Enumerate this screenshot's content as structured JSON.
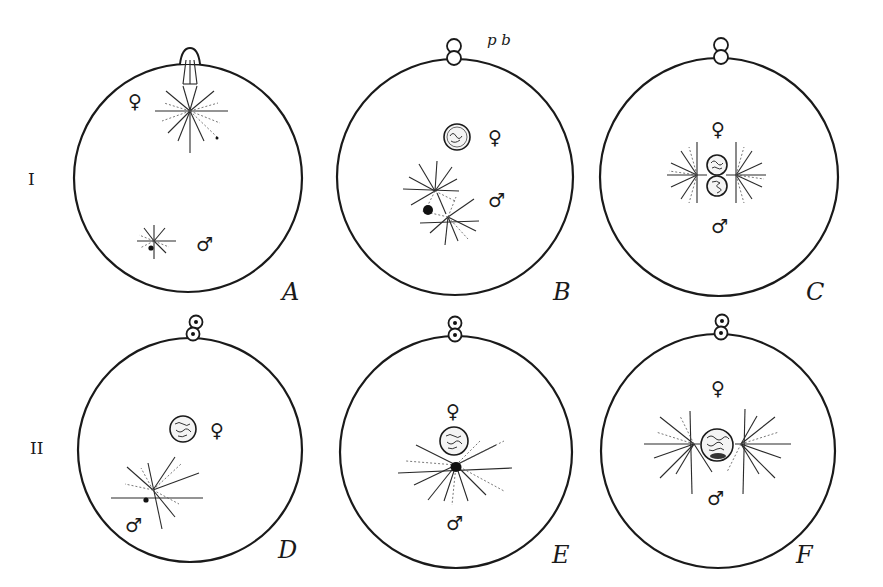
{
  "figure": {
    "row_labels": {
      "row1": "I",
      "row2": "II"
    },
    "polar_body_label": "p b",
    "symbols": {
      "female": "♀",
      "male": "♂"
    },
    "panels": [
      {
        "id": "A",
        "label": "A"
      },
      {
        "id": "B",
        "label": "B"
      },
      {
        "id": "C",
        "label": "C"
      },
      {
        "id": "D",
        "label": "D"
      },
      {
        "id": "E",
        "label": "E"
      },
      {
        "id": "F",
        "label": "F"
      }
    ]
  }
}
